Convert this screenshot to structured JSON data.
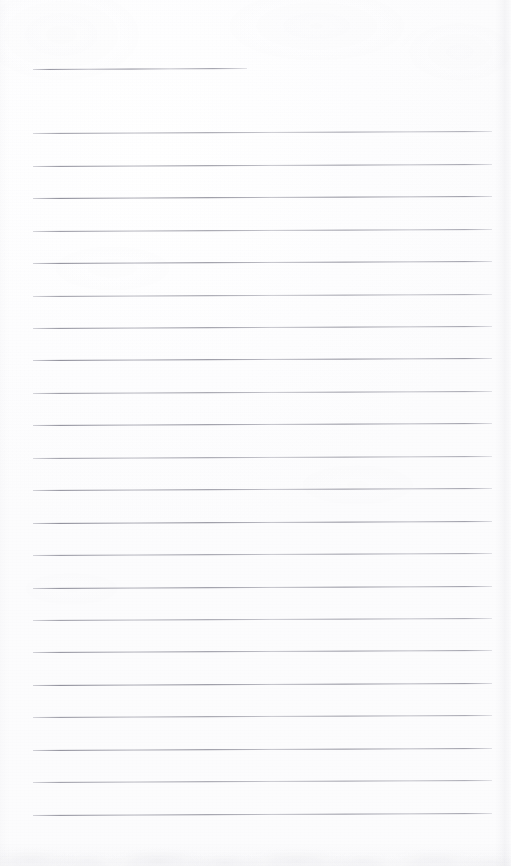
{
  "document": {
    "kind": "scanned-lined-paper",
    "page_width": 511,
    "page_height": 866,
    "paper_color": "#fdfdfd",
    "rule_color": "#7e7e8c",
    "rule_thickness_px": 1,
    "rule_left_x": 33,
    "rule_right_x": 492,
    "rule_spacing_px": 32.4,
    "rule_slope_deg": -0.25,
    "total_rule_count": 23,
    "writing_area_text": "",
    "header_text": "",
    "footer_text": "",
    "page_number": ""
  },
  "title_rule": {
    "name": "title-rule",
    "x": 33,
    "y": 69,
    "width": 214
  },
  "rules": [
    {
      "y": 133,
      "x": 33,
      "width": 459
    },
    {
      "y": 166,
      "x": 33,
      "width": 459
    },
    {
      "y": 198,
      "x": 33,
      "width": 459
    },
    {
      "y": 231,
      "x": 33,
      "width": 459
    },
    {
      "y": 263,
      "x": 33,
      "width": 459
    },
    {
      "y": 296,
      "x": 33,
      "width": 459
    },
    {
      "y": 328,
      "x": 33,
      "width": 459
    },
    {
      "y": 360,
      "x": 33,
      "width": 459
    },
    {
      "y": 393,
      "x": 33,
      "width": 459
    },
    {
      "y": 425,
      "x": 33,
      "width": 459
    },
    {
      "y": 458,
      "x": 33,
      "width": 459
    },
    {
      "y": 490,
      "x": 33,
      "width": 459
    },
    {
      "y": 523,
      "x": 33,
      "width": 459
    },
    {
      "y": 555,
      "x": 33,
      "width": 459
    },
    {
      "y": 588,
      "x": 33,
      "width": 459
    },
    {
      "y": 620,
      "x": 33,
      "width": 459
    },
    {
      "y": 652,
      "x": 33,
      "width": 459
    },
    {
      "y": 685,
      "x": 33,
      "width": 459
    },
    {
      "y": 717,
      "x": 33,
      "width": 459
    },
    {
      "y": 750,
      "x": 33,
      "width": 459
    },
    {
      "y": 782,
      "x": 33,
      "width": 459
    },
    {
      "y": 815,
      "x": 33,
      "width": 459
    }
  ]
}
